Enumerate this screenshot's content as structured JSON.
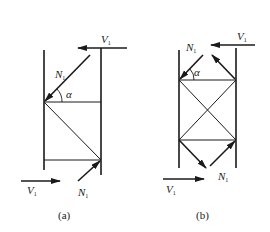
{
  "figures": [
    {
      "id": "a",
      "caption": "(a)",
      "labels": {
        "v_top": "V",
        "v_top_sub": "1",
        "n_top": "N",
        "n_top_sub": "1",
        "alpha": "α",
        "v_bottom": "V",
        "v_bottom_sub": "1",
        "n_bottom": "N",
        "n_bottom_sub": "1"
      }
    },
    {
      "id": "b",
      "caption": "(b)",
      "labels": {
        "v_top": "V",
        "v_top_sub": "1",
        "n_top": "N",
        "n_top_sub": "1",
        "alpha": "α",
        "v_bottom": "V",
        "v_bottom_sub": "1",
        "n_bottom": "N",
        "n_bottom_sub": "1"
      }
    }
  ],
  "colors": {
    "stroke": "#1a1a1a",
    "background": "#ffffff"
  }
}
